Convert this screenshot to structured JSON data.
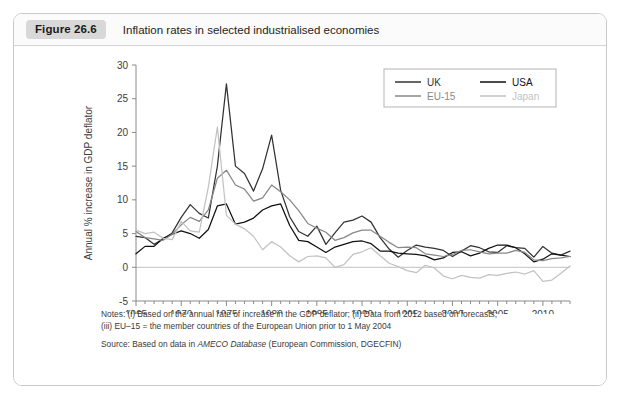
{
  "figure": {
    "badge": "Figure 26.6",
    "title": "Inflation rates in selected industrialised economies"
  },
  "notes": {
    "line1": "Notes: (i) Based on the annual rate of increase in the GDP deflator; (ii) Data from 2012 based on forecasts;",
    "line2": "(iii) EU–15 = the member countries of the European Union prior to 1 May 2004",
    "source_prefix": "Source: Based on data in ",
    "source_italic": "AMECO Database",
    "source_suffix": " (European Commission, DGECFIN)"
  },
  "chart_data": {
    "type": "line",
    "title": "Inflation rates in selected industrialised economies",
    "xlabel": "",
    "ylabel": "Annual % increase in GDP deflator",
    "xlim": [
      1965,
      2013
    ],
    "ylim": [
      -5,
      30
    ],
    "ytick_labels": [
      "30",
      "25",
      "20",
      "15",
      "10",
      "5",
      "0",
      "-5"
    ],
    "yticks": [
      30,
      25,
      20,
      15,
      10,
      5,
      0,
      -5
    ],
    "xtick_labels": [
      "1965",
      "1970",
      "1975",
      "1980",
      "1985",
      "1990",
      "1995",
      "2000",
      "2005",
      "2010"
    ],
    "xticks": [
      1965,
      1970,
      1975,
      1980,
      1985,
      1990,
      1995,
      2000,
      2005,
      2010
    ],
    "minor_xtick_interval": 1,
    "grid": false,
    "zero_line": true,
    "legend_position": "top-right",
    "colors": {
      "UK": "#333333",
      "USA": "#111111",
      "EU-15": "#888888",
      "Japan": "#c2c2c2"
    },
    "x": [
      1965,
      1966,
      1967,
      1968,
      1969,
      1970,
      1971,
      1972,
      1973,
      1974,
      1975,
      1976,
      1977,
      1978,
      1979,
      1980,
      1981,
      1982,
      1983,
      1984,
      1985,
      1986,
      1987,
      1988,
      1989,
      1990,
      1991,
      1992,
      1993,
      1994,
      1995,
      1996,
      1997,
      1998,
      1999,
      2000,
      2001,
      2002,
      2003,
      2004,
      2005,
      2006,
      2007,
      2008,
      2009,
      2010,
      2011,
      2012,
      2013
    ],
    "series": [
      {
        "name": "UK",
        "values": [
          4.6,
          4.4,
          3.4,
          4.2,
          5.1,
          7.4,
          9.3,
          8.0,
          7.3,
          15.0,
          27.2,
          15.0,
          13.9,
          11.3,
          14.6,
          19.6,
          11.4,
          7.5,
          5.3,
          4.6,
          6.1,
          3.4,
          5.1,
          6.7,
          7.0,
          7.6,
          6.7,
          4.4,
          2.7,
          1.5,
          2.5,
          3.3,
          3.0,
          2.8,
          2.5,
          1.6,
          2.4,
          3.2,
          2.9,
          2.3,
          2.2,
          3.2,
          2.9,
          2.8,
          1.5,
          3.1,
          2.1,
          1.8,
          2.4
        ]
      },
      {
        "name": "USA",
        "values": [
          2.0,
          3.1,
          3.1,
          4.3,
          4.9,
          5.4,
          5.0,
          4.3,
          5.6,
          9.1,
          9.4,
          6.4,
          6.7,
          7.3,
          8.5,
          9.1,
          9.4,
          6.2,
          4.0,
          3.8,
          3.0,
          2.2,
          3.0,
          3.4,
          3.8,
          3.9,
          3.5,
          2.4,
          2.4,
          2.1,
          2.0,
          1.9,
          1.7,
          1.1,
          1.4,
          2.2,
          2.3,
          1.7,
          2.1,
          2.8,
          3.3,
          3.3,
          2.9,
          2.0,
          0.8,
          1.2,
          2.0,
          1.8,
          1.6
        ]
      },
      {
        "name": "EU-15",
        "values": [
          5.3,
          4.4,
          4.2,
          4.0,
          4.9,
          6.3,
          7.4,
          6.8,
          8.5,
          13.2,
          14.4,
          12.2,
          11.6,
          9.8,
          10.3,
          12.2,
          11.2,
          10.0,
          8.4,
          6.5,
          5.8,
          5.2,
          4.0,
          4.4,
          5.1,
          5.5,
          5.5,
          4.6,
          3.7,
          2.9,
          3.0,
          2.9,
          2.0,
          1.8,
          1.6,
          1.9,
          2.5,
          2.6,
          2.3,
          2.0,
          2.1,
          2.1,
          2.5,
          2.2,
          1.1,
          1.0,
          1.3,
          1.4,
          1.6
        ]
      },
      {
        "name": "Japan",
        "values": [
          5.5,
          5.0,
          5.2,
          4.3,
          4.1,
          6.8,
          5.4,
          5.2,
          11.9,
          20.8,
          7.7,
          6.4,
          5.7,
          4.6,
          2.6,
          3.8,
          3.0,
          1.7,
          0.8,
          1.6,
          1.7,
          1.4,
          0.0,
          0.4,
          1.9,
          2.3,
          2.9,
          1.7,
          0.6,
          0.1,
          -0.5,
          -0.8,
          0.3,
          -0.1,
          -1.3,
          -1.7,
          -1.2,
          -1.5,
          -1.6,
          -1.1,
          -1.2,
          -0.9,
          -0.7,
          -1.0,
          -0.5,
          -2.1,
          -1.9,
          -0.9,
          0.2
        ]
      }
    ],
    "legend": [
      {
        "label": "UK",
        "color": "#333333"
      },
      {
        "label": "USA",
        "color": "#111111"
      },
      {
        "label": "EU-15",
        "color": "#888888"
      },
      {
        "label": "Japan",
        "color": "#c2c2c2"
      }
    ]
  }
}
